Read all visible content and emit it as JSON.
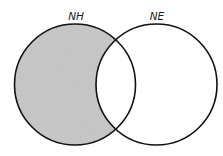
{
  "diagram": {
    "type": "venn",
    "sets": [
      {
        "id": "NH",
        "label": "NH",
        "shaded": true,
        "shaded_region": "NH only (excluding overlap with NE)"
      },
      {
        "id": "NE",
        "label": "NE",
        "shaded": false
      }
    ],
    "colors": {
      "shade_fill": "#c6c6c6",
      "outline": "#111111",
      "background": "#ffffff",
      "label": "#1a1a1a"
    }
  }
}
